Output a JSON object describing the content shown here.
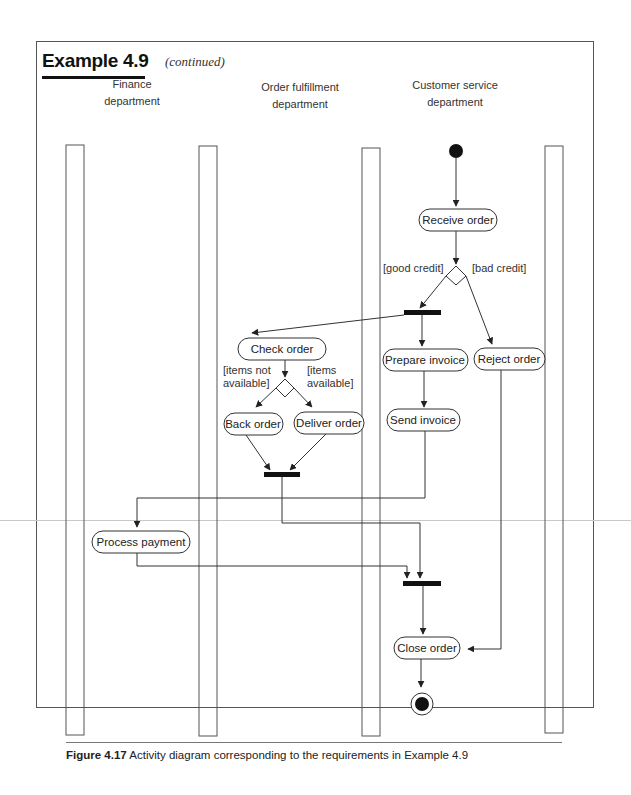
{
  "header": {
    "title": "Example 4.9",
    "subtitle": "(continued)"
  },
  "swimlanes": [
    {
      "label_line1": "Finance",
      "label_line2": "department"
    },
    {
      "label_line1": "Order fulfillment",
      "label_line2": "department"
    },
    {
      "label_line1": "Customer service",
      "label_line2": "department"
    }
  ],
  "nodes": {
    "initial": "initial-node",
    "receive_order": "Receive order",
    "check_order": "Check order",
    "prepare_invoice": "Prepare invoice",
    "reject_order": "Reject order",
    "back_order": "Back order",
    "deliver_order": "Deliver order",
    "send_invoice": "Send invoice",
    "process_payment": "Process payment",
    "close_order": "Close order",
    "final": "final-node"
  },
  "guards": {
    "good_credit": "[good credit]",
    "bad_credit": "[bad credit]",
    "items_not_available_1": "[items not",
    "items_not_available_2": "available]",
    "items_available_1": "[items",
    "items_available_2": "available]"
  },
  "caption": {
    "label": "Figure 4.17",
    "text": "Activity diagram corresponding to the requirements in Example 4.9"
  },
  "colors": {
    "line": "#333333",
    "bar": "#111111",
    "frame": "#555555"
  }
}
